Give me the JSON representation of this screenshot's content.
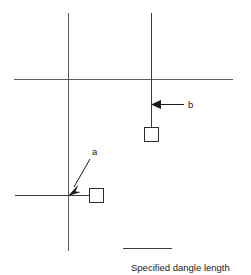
{
  "figure": {
    "type": "technical-diagram",
    "background_color": "#ffffff",
    "width": 251,
    "height": 275
  },
  "annotations": {
    "label_a": "a",
    "label_b": "b"
  },
  "legend": {
    "caption": "Specified dangle length",
    "swatch_color": "#3c3c3c"
  },
  "colors": {
    "grid": "#5a5a5a",
    "dangle": "#3c3c3c",
    "square_stroke": "#2b2b2b",
    "square_fill": "#ffffff",
    "leader": "#1a1a1a",
    "text": "#1a1a1a"
  },
  "geometry": {
    "grid_lines": [
      {
        "name": "horizontal-main",
        "x1": 14,
        "y1": 79,
        "x2": 233,
        "y2": 79
      },
      {
        "name": "vertical-left",
        "x1": 68,
        "y1": 13,
        "x2": 68,
        "y2": 251
      },
      {
        "name": "vertical-right",
        "x1": 151,
        "y1": 13,
        "x2": 151,
        "y2": 142
      },
      {
        "name": "horizontal-lower-left",
        "x1": 15,
        "y1": 195,
        "x2": 88,
        "y2": 195
      }
    ],
    "endpoints": [
      {
        "name": "endpoint-square-a",
        "x": 89,
        "y": 188,
        "size": 14
      },
      {
        "name": "endpoint-square-b",
        "x": 144,
        "y": 127,
        "size": 14
      }
    ],
    "leaders": [
      {
        "name": "leader-a",
        "x1": 90,
        "y1": 158,
        "x2": 71,
        "y2": 191
      },
      {
        "name": "leader-b",
        "x1": 184,
        "y1": 104,
        "x2": 157,
        "y2": 104
      }
    ],
    "label_positions": {
      "a": {
        "x": 92,
        "y": 155
      },
      "b": {
        "x": 188,
        "y": 108
      }
    },
    "legend_swatch": {
      "x1": 123,
      "y1": 248,
      "x2": 172,
      "y2": 248
    },
    "legend_caption_position": {
      "x": 131,
      "y": 271
    }
  }
}
